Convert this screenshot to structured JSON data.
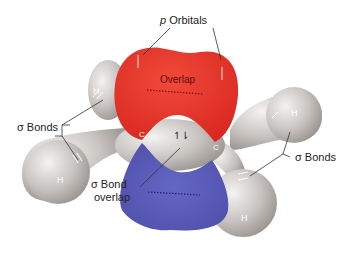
{
  "labels": {
    "p_orbitals_prefix": "p",
    "p_orbitals": "Orbitals",
    "overlap": "Overlap",
    "sigma_bonds_left": "σ Bonds",
    "sigma_bonds_right": "σ Bonds",
    "sigma_bond_overlap_line1": "σ  Bond",
    "sigma_bond_overlap_line2": "overlap",
    "carbon_left": "C",
    "carbon_right": "C",
    "hydrogen_top_left": "H",
    "hydrogen_bottom_left": "H",
    "hydrogen_top_right": "H",
    "hydrogen_bottom_right": "H",
    "electron_pair": "↿⇂"
  },
  "colors": {
    "upper_lobe": "#e8302a",
    "lower_lobe": "#5a5cb8",
    "atoms": "#c9c6c4",
    "background": "#ffffff"
  }
}
